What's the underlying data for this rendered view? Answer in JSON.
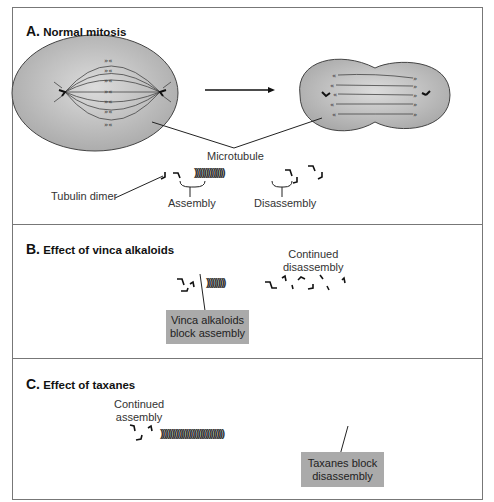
{
  "sectionA": {
    "letter": "A.",
    "title": "Normal mitosis",
    "microtubule_label": "Microtubule",
    "dimer_label": "Tubulin dimer",
    "assembly_label": "Assembly",
    "disassembly_label": "Disassembly",
    "chain": "))))))))))))))))"
  },
  "sectionB": {
    "letter": "B.",
    "title": "Effect of vinca alkaloids",
    "continued_line1": "Continued",
    "continued_line2": "disassembly",
    "box_line1": "Vinca alkaloids",
    "box_line2": "block assembly",
    "chain": "))))))))))"
  },
  "sectionC": {
    "letter": "C.",
    "title": "Effect of taxanes",
    "continued_line1": "Continued",
    "continued_line2": "assembly",
    "box_line1": "Taxanes block",
    "box_line2": "disassembly",
    "chain": "))))))))))))))))))))))))))))))))))"
  },
  "colors": {
    "cell_fill": "#b8b8b8",
    "box_fill": "#aaaaaa",
    "line": "#333333",
    "frame": "#777777"
  }
}
